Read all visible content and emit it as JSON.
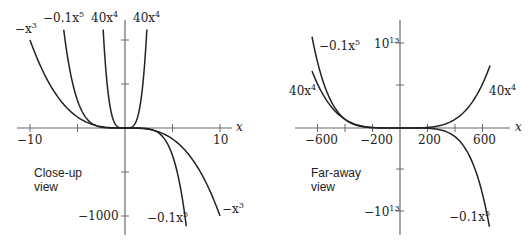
{
  "chart_data": [
    {
      "type": "line",
      "title": "Close-up view",
      "xlabel": "x",
      "ylabel": "",
      "xlim": [
        -10,
        10
      ],
      "ylim": [
        -1130,
        1100
      ],
      "x_ticks": [
        -10,
        -5,
        0,
        5,
        10
      ],
      "x_tick_labels": [
        "−10",
        "",
        "",
        "",
        "10"
      ],
      "y_ticks": [
        1000,
        500,
        -500,
        -1000
      ],
      "y_tick_labels": [
        "",
        "",
        "",
        "−1000"
      ],
      "grid": false,
      "series": [
        {
          "name": "-x^3",
          "label": "−x³",
          "formula": "-x^3",
          "x_range": [
            -10,
            10
          ]
        },
        {
          "name": "-0.1x^5",
          "label": "−0.1x⁵",
          "formula": "-0.1*x^5",
          "x_range": [
            -6.45,
            6.45
          ]
        },
        {
          "name": "40x^4",
          "label": "40x⁴",
          "formula": "40*x^4",
          "x_range": [
            -2.3,
            2.3
          ]
        }
      ],
      "annotations": [
        "−x³",
        "−0.1x⁵",
        "40x⁴",
        "40x⁴",
        "−0.1x⁵",
        "−x³",
        "Close-up view"
      ]
    },
    {
      "type": "line",
      "title": "Far-away view",
      "xlabel": "x",
      "ylabel": "",
      "xlim": [
        -700,
        700
      ],
      "ylim": [
        -12500000000000.0,
        11000000000000.0
      ],
      "x_ticks": [
        -600,
        -400,
        -200,
        0,
        200,
        400,
        600
      ],
      "x_tick_labels": [
        "−600",
        "",
        "−200",
        "",
        "200",
        "",
        "600"
      ],
      "y_ticks": [
        10000000000000.0,
        5000000000000.0,
        -5000000000000.0,
        -10000000000000.0
      ],
      "y_tick_labels": [
        "10¹³",
        "",
        "",
        "−10¹³"
      ],
      "grid": false,
      "series": [
        {
          "name": "-0.1x^5",
          "label": "−0.1x⁵",
          "formula": "-0.1*x^5",
          "x_range": [
            -640,
            650
          ]
        },
        {
          "name": "40x^4",
          "label": "40x⁴",
          "formula": "40*x^4",
          "x_range": [
            -640,
            655
          ]
        }
      ],
      "annotations": [
        "−0.1x⁵",
        "40x⁴",
        "40x⁴",
        "−0.1x⁵",
        "Far-away view"
      ]
    }
  ],
  "left": {
    "caption_line1": "Close-up",
    "caption_line2": "view",
    "x_axis_label": "x",
    "tick_neg10": "−10",
    "tick_10": "10",
    "tick_neg1000": "−1000",
    "labels": {
      "neg_x3_top": "−x",
      "neg_x3_top_exp": "3",
      "neg01x5_top": "−0.1x",
      "neg01x5_top_exp": "5",
      "x4_left": "40x",
      "x4_left_exp": "4",
      "x4_right": "40x",
      "x4_right_exp": "4",
      "neg01x5_bottom": "−0.1x",
      "neg01x5_bottom_exp": "5",
      "neg_x3_bottom": "−x",
      "neg_x3_bottom_exp": "3"
    }
  },
  "right": {
    "caption_line1": "Far-away",
    "caption_line2": "view",
    "x_axis_label": "x",
    "tick_neg600": "−600",
    "tick_neg200": "−200",
    "tick_200": "200",
    "tick_600": "600",
    "tick_1e13": "10",
    "tick_1e13_exp": "13",
    "tick_neg1e13": "−10",
    "tick_neg1e13_exp": "13",
    "labels": {
      "neg01x5_top": "−0.1x",
      "neg01x5_top_exp": "5",
      "x4_left": "40x",
      "x4_left_exp": "4",
      "x4_right": "40x",
      "x4_right_exp": "4",
      "neg01x5_bottom": "−0.1x",
      "neg01x5_bottom_exp": "5"
    }
  }
}
